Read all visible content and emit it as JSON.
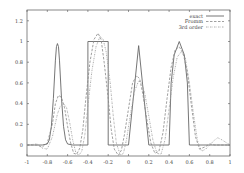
{
  "chart_data": {
    "type": "line",
    "title": "",
    "xlabel": "",
    "ylabel": "",
    "xlim": [
      -1,
      1
    ],
    "ylim": [
      -0.1,
      1.33
    ],
    "grid": false,
    "legend_position": "top-right",
    "x_ticks": [
      "-1",
      "-0.8",
      "-0.6",
      "-0.4",
      "-0.2",
      "0",
      "0.2",
      "0.4",
      "0.6",
      "0.8",
      "1"
    ],
    "y_ticks": [
      "0",
      "0.2",
      "0.4",
      "0.6",
      "0.8",
      "1",
      "1.2"
    ],
    "legend": [
      "exact",
      "Fromm",
      "3rd order"
    ],
    "series": [
      {
        "name": "exact",
        "style": "solid",
        "x": [
          -1,
          -0.85,
          -0.8,
          -0.78,
          -0.76,
          -0.74,
          -0.72,
          -0.71,
          -0.7,
          -0.69,
          -0.68,
          -0.66,
          -0.64,
          -0.62,
          -0.6,
          -0.55,
          -0.4,
          -0.4,
          -0.2,
          -0.2,
          0.0,
          0.0,
          0.1,
          0.2,
          0.2,
          0.4,
          0.4,
          0.42,
          0.45,
          0.5,
          0.55,
          0.58,
          0.6,
          0.6,
          1.0
        ],
        "y": [
          0,
          0,
          0.01,
          0.05,
          0.18,
          0.45,
          0.82,
          0.95,
          0.98,
          0.95,
          0.82,
          0.45,
          0.18,
          0.05,
          0.01,
          0,
          0,
          1.0,
          1.0,
          0,
          0,
          0,
          0.96,
          0,
          0,
          0,
          0,
          0.6,
          0.87,
          1.0,
          0.87,
          0.6,
          0,
          0,
          0
        ]
      },
      {
        "name": "Fromm",
        "style": "dashed",
        "x": [
          -1,
          -0.9,
          -0.85,
          -0.8,
          -0.75,
          -0.72,
          -0.69,
          -0.66,
          -0.63,
          -0.6,
          -0.57,
          -0.54,
          -0.51,
          -0.48,
          -0.45,
          -0.42,
          -0.38,
          -0.34,
          -0.3,
          -0.27,
          -0.24,
          -0.2,
          -0.17,
          -0.14,
          -0.1,
          -0.07,
          -0.04,
          0.0,
          0.04,
          0.08,
          0.11,
          0.14,
          0.18,
          0.22,
          0.26,
          0.3,
          0.34,
          0.38,
          0.42,
          0.46,
          0.5,
          0.54,
          0.58,
          0.62,
          0.66,
          0.7,
          0.75,
          0.8,
          0.85,
          0.9,
          1.0
        ],
        "y": [
          0,
          0.0,
          -0.02,
          0.02,
          0.2,
          0.4,
          0.48,
          0.46,
          0.36,
          0.18,
          0.02,
          -0.08,
          -0.09,
          -0.03,
          0.15,
          0.45,
          0.8,
          1.02,
          1.08,
          1.02,
          0.8,
          0.45,
          0.15,
          -0.04,
          -0.1,
          -0.05,
          0.1,
          0.35,
          0.6,
          0.67,
          0.64,
          0.5,
          0.25,
          0.02,
          -0.08,
          -0.06,
          0.12,
          0.45,
          0.75,
          0.92,
          0.95,
          0.88,
          0.7,
          0.38,
          0.08,
          -0.04,
          -0.02,
          0.01,
          0.0,
          0.0,
          0
        ]
      },
      {
        "name": "3rd order",
        "style": "dotted",
        "x": [
          -1,
          -0.9,
          -0.85,
          -0.8,
          -0.75,
          -0.7,
          -0.67,
          -0.64,
          -0.61,
          -0.58,
          -0.55,
          -0.52,
          -0.49,
          -0.46,
          -0.43,
          -0.4,
          -0.36,
          -0.32,
          -0.28,
          -0.25,
          -0.22,
          -0.18,
          -0.15,
          -0.12,
          -0.08,
          -0.05,
          -0.02,
          0.02,
          0.06,
          0.1,
          0.13,
          0.16,
          0.2,
          0.24,
          0.28,
          0.32,
          0.36,
          0.4,
          0.44,
          0.48,
          0.52,
          0.56,
          0.6,
          0.64,
          0.68,
          0.72,
          0.76,
          0.8,
          0.85,
          0.88,
          0.92,
          1.0
        ],
        "y": [
          0,
          0.01,
          -0.03,
          -0.04,
          0.08,
          0.3,
          0.38,
          0.4,
          0.36,
          0.22,
          0.05,
          -0.07,
          -0.1,
          -0.06,
          0.1,
          0.38,
          0.72,
          0.95,
          1.05,
          1.02,
          0.9,
          0.6,
          0.28,
          0.02,
          -0.1,
          -0.08,
          0.05,
          0.3,
          0.52,
          0.62,
          0.6,
          0.5,
          0.28,
          0.05,
          -0.08,
          -0.09,
          0.05,
          0.35,
          0.65,
          0.85,
          0.9,
          0.84,
          0.6,
          0.3,
          0.04,
          -0.06,
          -0.04,
          0.0,
          0.05,
          0.07,
          0.05,
          0
        ]
      }
    ]
  },
  "colors": {
    "axis": "#555555",
    "exact": "#666666",
    "fromm": "#888888",
    "third": "#999999",
    "background": "#ffffff"
  }
}
